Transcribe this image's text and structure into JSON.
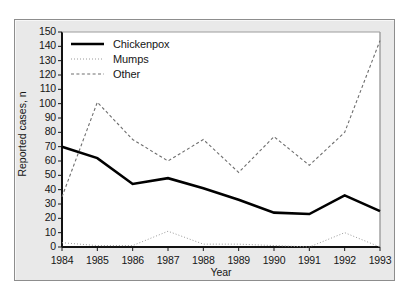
{
  "figure": {
    "background_color": "#e9e9e9",
    "plot_background_color": "#ffffff",
    "border_color": "#8d8d8d"
  },
  "legend": {
    "position": "top-left-inside",
    "entries": [
      {
        "label": "Chickenpox",
        "style": "solid",
        "color": "#000000",
        "icon": "solid-line-icon"
      },
      {
        "label": "Mumps",
        "style": "dotted",
        "color": "#9a9a9a",
        "icon": "dotted-line-icon"
      },
      {
        "label": "Other",
        "style": "dashed",
        "color": "#6e6e6e",
        "icon": "dashed-line-icon"
      }
    ]
  },
  "chart_data": {
    "type": "line",
    "title": "",
    "xlabel": "Year",
    "ylabel": "Reported cases, n",
    "categories": [
      "1984",
      "1985",
      "1986",
      "1987",
      "1988",
      "1989",
      "1990",
      "1991",
      "1992",
      "1993"
    ],
    "x": [
      1984,
      1985,
      1986,
      1987,
      1988,
      1989,
      1990,
      1991,
      1992,
      1993
    ],
    "xlim": [
      1984,
      1993
    ],
    "ylim": [
      0,
      150
    ],
    "ytick_values": [
      0,
      10,
      20,
      30,
      40,
      50,
      60,
      70,
      80,
      90,
      100,
      110,
      120,
      130,
      140,
      150
    ],
    "ytick_labels": [
      "0",
      "10",
      "20",
      "30",
      "40",
      "50",
      "60",
      "70",
      "80",
      "90",
      "100",
      "110",
      "120",
      "130",
      "140",
      "150"
    ],
    "xtick_labels": [
      "1984",
      "1985",
      "1986",
      "1987",
      "1988",
      "1989",
      "1990",
      "1991",
      "1992",
      "1993"
    ],
    "grid": false,
    "legend_position": "upper left",
    "series": [
      {
        "name": "Chickenpox",
        "style": "solid",
        "color": "#000000",
        "values": [
          70,
          62,
          44,
          48,
          41,
          33,
          24,
          23,
          36,
          25
        ]
      },
      {
        "name": "Mumps",
        "style": "dotted",
        "color": "#9a9a9a",
        "values": [
          3,
          1,
          1,
          11,
          2,
          2,
          1,
          0,
          10,
          0
        ]
      },
      {
        "name": "Other",
        "style": "dashed",
        "color": "#6e6e6e",
        "values": [
          35,
          101,
          75,
          60,
          75,
          52,
          77,
          57,
          80,
          144
        ]
      }
    ]
  }
}
